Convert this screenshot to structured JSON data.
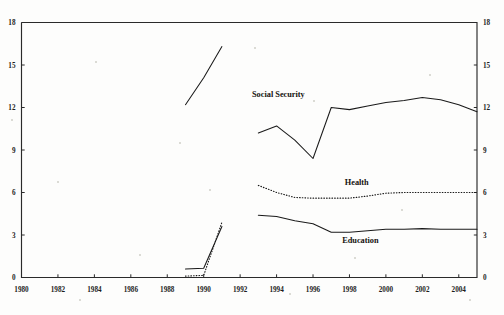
{
  "chart_data": {
    "type": "line",
    "title": "",
    "subtitle": "",
    "xlabel": "",
    "ylabel": "",
    "xlim": [
      1980,
      2005
    ],
    "ylim": [
      0,
      18
    ],
    "grid": false,
    "legend": "inline-annotations",
    "x_ticks": [
      1980,
      1982,
      1984,
      1986,
      1988,
      1990,
      1992,
      1994,
      1996,
      1998,
      2000,
      2002,
      2004
    ],
    "x_tick_labels": [
      "1980",
      "1982",
      "1984",
      "1986",
      "1988",
      "1990",
      "1992",
      "1994",
      "1996",
      "1998",
      "2000",
      "2002",
      "2004"
    ],
    "y_ticks": [
      0,
      3,
      6,
      9,
      12,
      15,
      18
    ],
    "y_tick_labels_left": [
      "0",
      "3",
      "6",
      "9",
      "12",
      "15",
      "18"
    ],
    "y_tick_labels_right": [
      "0",
      "3",
      "6",
      "9",
      "12",
      "15",
      "18"
    ],
    "series": [
      {
        "name": "Social Security",
        "style": "solid",
        "label": "Social Security",
        "label_x": 1994.1,
        "label_y": 12.75,
        "segments": [
          {
            "x": [
              1989,
              1990,
              1991
            ],
            "values": [
              12.2,
              14.1,
              16.3
            ]
          },
          {
            "x": [
              1993,
              1994,
              1995,
              1996,
              1997,
              1998,
              1999,
              2000,
              2001,
              2002,
              2003,
              2004,
              2005
            ],
            "values": [
              10.2,
              10.7,
              9.7,
              8.4,
              12.0,
              11.85,
              12.1,
              12.35,
              12.5,
              12.7,
              12.55,
              12.2,
              11.7
            ]
          }
        ]
      },
      {
        "name": "Health",
        "style": "dotted",
        "label": "Health",
        "label_x": 1998.4,
        "label_y": 6.55,
        "segments": [
          {
            "x": [
              1989,
              1990,
              1991
            ],
            "values": [
              0.1,
              0.15,
              3.9
            ]
          },
          {
            "x": [
              1993,
              1994,
              1995,
              1996,
              1997,
              1998,
              1999,
              2000,
              2001,
              2002,
              2003,
              2004,
              2005
            ],
            "values": [
              6.5,
              6.0,
              5.65,
              5.6,
              5.6,
              5.6,
              5.75,
              5.95,
              6.0,
              6.0,
              6.0,
              6.0,
              6.0
            ]
          }
        ]
      },
      {
        "name": "Education",
        "style": "solid",
        "label": "Education",
        "label_x": 1998.6,
        "label_y": 2.45,
        "segments": [
          {
            "x": [
              1989,
              1990,
              1991
            ],
            "values": [
              0.6,
              0.65,
              3.6
            ]
          },
          {
            "x": [
              1993,
              1994,
              1995,
              1996,
              1997,
              1998,
              1999,
              2000,
              2001,
              2002,
              2003,
              2004,
              2005
            ],
            "values": [
              4.4,
              4.3,
              4.0,
              3.8,
              3.2,
              3.2,
              3.3,
              3.4,
              3.4,
              3.45,
              3.4,
              3.4,
              3.4
            ]
          }
        ]
      }
    ]
  }
}
